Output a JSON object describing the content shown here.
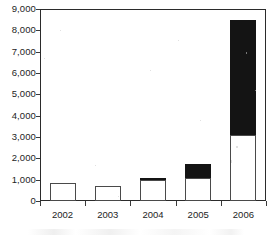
{
  "chart_data": {
    "type": "bar",
    "title": "",
    "subtitle": "",
    "xlabel": "",
    "ylabel": "",
    "categories": [
      "2002",
      "2003",
      "2004",
      "2005",
      "2006"
    ],
    "series": [
      {
        "name": "lower-segment",
        "color": "#ffffff",
        "values": [
          850,
          720,
          1000,
          1100,
          3100
        ]
      },
      {
        "name": "upper-segment",
        "color": "#141414",
        "values": [
          0,
          0,
          80,
          650,
          5400
        ]
      }
    ],
    "totals": [
      850,
      720,
      1080,
      1750,
      8500
    ],
    "stacked": true,
    "ylim": [
      0,
      9000
    ],
    "ytick_values": [
      0,
      1000,
      2000,
      3000,
      4000,
      5000,
      6000,
      7000,
      8000,
      9000
    ],
    "ytick_labels": [
      "0",
      "1,000",
      "2,000",
      "3,000",
      "4,000",
      "5,000",
      "6,000",
      "7,000",
      "8,000",
      "9,000"
    ],
    "grid": false,
    "legend": "none",
    "frame": "box"
  },
  "axes": {
    "y": {
      "ticks": [
        {
          "label": "9,000",
          "value": 9000
        },
        {
          "label": "8,000",
          "value": 8000
        },
        {
          "label": "7,000",
          "value": 7000
        },
        {
          "label": "6,000",
          "value": 6000
        },
        {
          "label": "5,000",
          "value": 5000
        },
        {
          "label": "4,000",
          "value": 4000
        },
        {
          "label": "3,000",
          "value": 3000
        },
        {
          "label": "2,000",
          "value": 2000
        },
        {
          "label": "1,000",
          "value": 1000
        },
        {
          "label": "0",
          "value": 0
        }
      ]
    },
    "x": {
      "ticks": [
        {
          "label": "2002"
        },
        {
          "label": "2003"
        },
        {
          "label": "2004"
        },
        {
          "label": "2005"
        },
        {
          "label": "2006"
        }
      ]
    }
  },
  "colors": {
    "segment_lower": "#ffffff",
    "segment_upper": "#141414",
    "outline": "#4a4a4a",
    "axis": "#2b2b2b",
    "text": "#242424"
  }
}
